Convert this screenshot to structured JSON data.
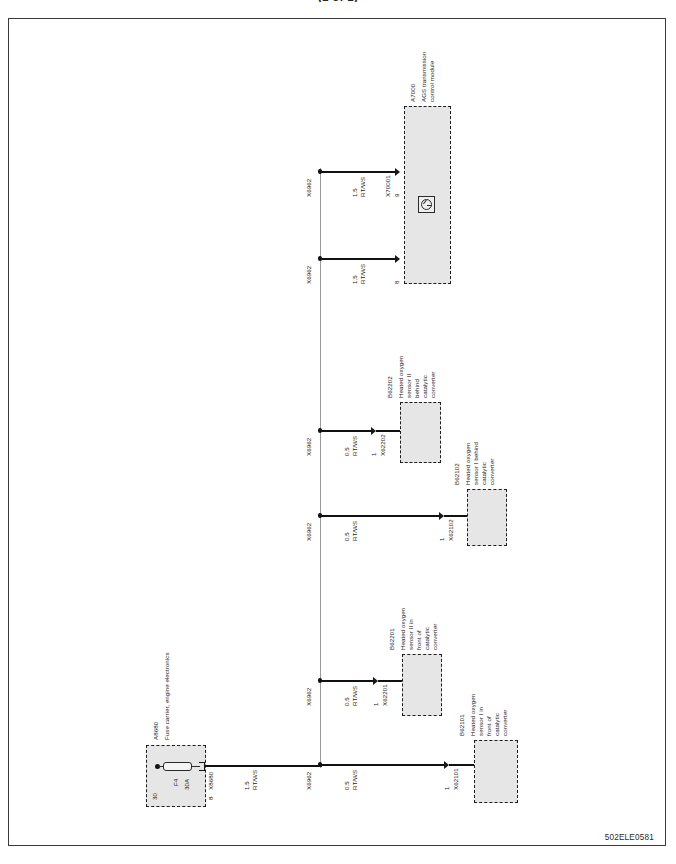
{
  "document": {
    "top_title": "(1 of 1)",
    "doc_code": "502ELE0581"
  },
  "components": {
    "fuse_carrier": {
      "id": "A8680",
      "name": "Fuse carrier, engine electronics",
      "fuse_designation": "F4",
      "fuse_rating": "30A",
      "input_terminal": "30",
      "output_terminal": "8",
      "connector": "X8680"
    },
    "tcm": {
      "id": "A7000",
      "name": "AGS transmission control module",
      "connector": "X70001",
      "terminal_upper": "9",
      "terminal_lower": "8",
      "symbol": "motor-symbol"
    },
    "sensors": [
      {
        "id": "B62101",
        "name": "Heated oxygen sensor I in front of catalytic converter",
        "name_lines": [
          "Heated oxygen",
          "sensor I in",
          "front of",
          "catalytic",
          "converter"
        ],
        "connector": "X62101",
        "terminal": "1"
      },
      {
        "id": "B62201",
        "name": "Heated oxygen sensor II in front of catalytic converter",
        "name_lines": [
          "Heated oxygen",
          "sensor II in",
          "front of",
          "catalytic",
          "converter"
        ],
        "connector": "X62201",
        "terminal": "1"
      },
      {
        "id": "B62102",
        "name": "Heated oxygen sensor I behind catalytic converter",
        "name_lines": [
          "Heated oxygen",
          "sensor I behind",
          "catalytic",
          "converter"
        ],
        "connector": "X62102",
        "terminal": "1"
      },
      {
        "id": "B62202",
        "name": "Heated oxygen sensor II behind catalytic converter",
        "name_lines": [
          "Heated oxygen",
          "sensor II",
          "behind",
          "catalytic",
          "converter"
        ],
        "connector": "X62202",
        "terminal": "1"
      }
    ]
  },
  "bus": {
    "node_label": "X6962",
    "node_labels": [
      "X6962",
      "X6962",
      "X6962",
      "X6962",
      "X6962",
      "X6962"
    ]
  },
  "wires": {
    "supply": {
      "size": "1.5",
      "color_code": "RT/WS",
      "label_lines": [
        "1.5",
        "RT/WS"
      ]
    },
    "branches": [
      {
        "size": "0.5",
        "color_code": "RT/WS",
        "label_lines": [
          "0.5",
          "RT/WS"
        ],
        "target": "X62101"
      },
      {
        "size": "0.5",
        "color_code": "RT/WS",
        "label_lines": [
          "0.5",
          "RT/WS"
        ],
        "target": "X62201"
      },
      {
        "size": "0.5",
        "color_code": "RT/WS",
        "label_lines": [
          "0.5",
          "RT/WS"
        ],
        "target": "X62102"
      },
      {
        "size": "0.5",
        "color_code": "RT/WS",
        "label_lines": [
          "0.5",
          "RT/WS"
        ],
        "target": "X62202"
      },
      {
        "size": "1.5",
        "color_code": "RT/WS",
        "label_lines": [
          "1.5",
          "RT/WS"
        ],
        "target": "X70001-8"
      },
      {
        "size": "1.5",
        "color_code": "RT/WS",
        "label_lines": [
          "1.5",
          "RT/WS"
        ],
        "target": "X70001-9"
      }
    ]
  },
  "colors": {
    "wire": "#111111",
    "bus": "#9a9a9a",
    "component_fill": "#e6e6e6",
    "component_border": "#1d1d1d",
    "frame": "#3a3a3a"
  }
}
